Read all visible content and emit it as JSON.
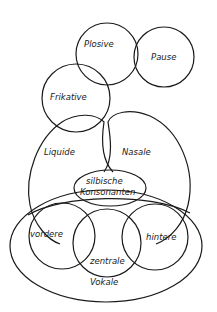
{
  "diagram": {
    "type": "venn",
    "colors": {
      "stroke": "#1a1a1a",
      "background": "#ffffff"
    },
    "sets": [
      {
        "id": "plosive",
        "label": "Plosive"
      },
      {
        "id": "pause",
        "label": "Pause"
      },
      {
        "id": "frikative",
        "label": "Frikative"
      },
      {
        "id": "liquide",
        "label": "Liquide"
      },
      {
        "id": "nasale",
        "label": "Nasale"
      },
      {
        "id": "silbische",
        "label_line1": "silbische",
        "label_line2": "Konsonanten"
      },
      {
        "id": "vordere",
        "label": "vordere"
      },
      {
        "id": "zentrale",
        "label": "zentrale"
      },
      {
        "id": "hintere",
        "label": "hintere"
      },
      {
        "id": "vokale",
        "label": "Vokale"
      }
    ]
  }
}
